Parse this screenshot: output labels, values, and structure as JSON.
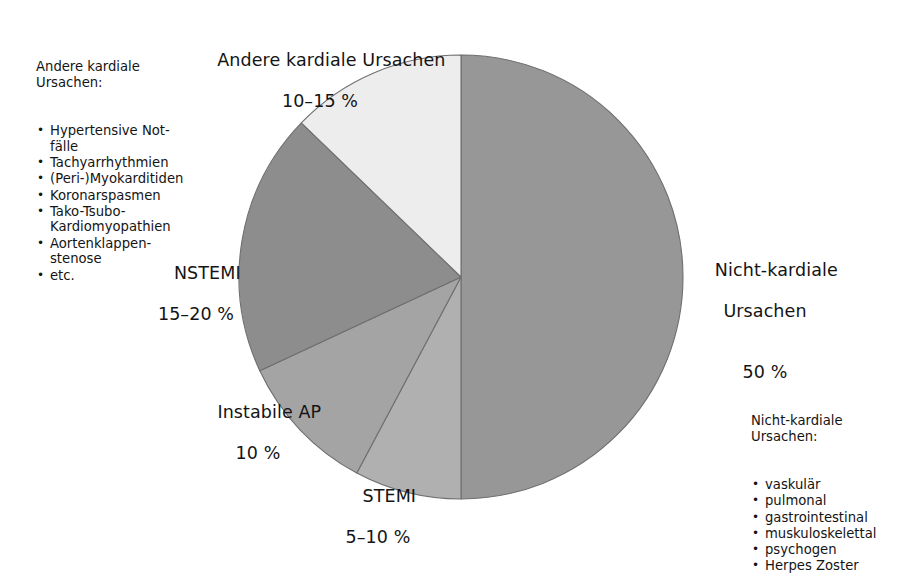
{
  "chart_data": {
    "type": "pie",
    "title": "",
    "legend_position": "labels-around-pie",
    "unit": "%",
    "center": {
      "x": 461,
      "y": 277
    },
    "radius": 222,
    "start_angle_deg": 0,
    "direction": "clockwise",
    "categories": [
      "Nicht-kardiale Ursachen",
      "STEMI",
      "Instabile AP",
      "NSTEMI",
      "Andere kardiale Ursachen"
    ],
    "values": [
      50,
      7.5,
      10,
      17.5,
      15
    ],
    "value_labels": [
      "50 %",
      "5–10 %",
      "10 %",
      "15–20 %",
      "10–15 %"
    ],
    "slices": [
      {
        "name": "Nicht-kardiale Ursachen",
        "label": "Nicht-kardiale\nUrsachen",
        "value_label": "50 %",
        "share": 50,
        "start_deg": 0,
        "end_deg": 180,
        "color": "#979797"
      },
      {
        "name": "STEMI",
        "label": "STEMI",
        "value_label": "5–10 %",
        "share": 7.5,
        "start_deg": 180,
        "end_deg": 208,
        "color": "#b0b0b0"
      },
      {
        "name": "Instabile AP",
        "label": "Instabile AP",
        "value_label": "10 %",
        "share": 10,
        "start_deg": 208,
        "end_deg": 245,
        "color": "#a4a4a4"
      },
      {
        "name": "NSTEMI",
        "label": "NSTEMI",
        "value_label": "15–20 %",
        "share": 17.5,
        "start_deg": 245,
        "end_deg": 314,
        "color": "#8d8d8d"
      },
      {
        "name": "Andere kardiale Ursachen",
        "label": "Andere kardiale Ursachen",
        "value_label": "10–15 %",
        "share": 15,
        "start_deg": 314,
        "end_deg": 360,
        "color": "#ededed"
      }
    ],
    "stroke_color": "#6f6f6f",
    "background": "#ffffff"
  },
  "labels": {
    "andere_kardiale": {
      "name": "Andere kardiale Ursachen",
      "pct": "10–15 %"
    },
    "nicht_kardiale": {
      "line1": "Nicht-kardiale",
      "line2": "Ursachen",
      "pct": "50 %"
    },
    "nstemi": {
      "name": "NSTEMI",
      "pct": "15–20 %"
    },
    "instabile_ap": {
      "name": "Instabile AP",
      "pct": "10 %"
    },
    "stemi": {
      "name": "STEMI",
      "pct": "5–10 %"
    }
  },
  "annotations": {
    "kardial": {
      "title": "Andere kardiale\nUrsachen:",
      "bullet": "•",
      "items": [
        "Hypertensive Not-\nfälle",
        "Tachyarrhythmien",
        "(Peri-)Myokarditiden",
        "Koronarspasmen",
        "Tako-Tsubo-\nKardiomyopathien",
        "Aortenklappen-\nstenose",
        "etc."
      ]
    },
    "nicht_kardial": {
      "title": "Nicht-kardiale\nUrsachen:",
      "bullet": "•",
      "items": [
        "vaskulär",
        "pulmonal",
        "gastrointestinal",
        "muskuloskelettal",
        "psychogen",
        "Herpes Zoster"
      ]
    }
  }
}
